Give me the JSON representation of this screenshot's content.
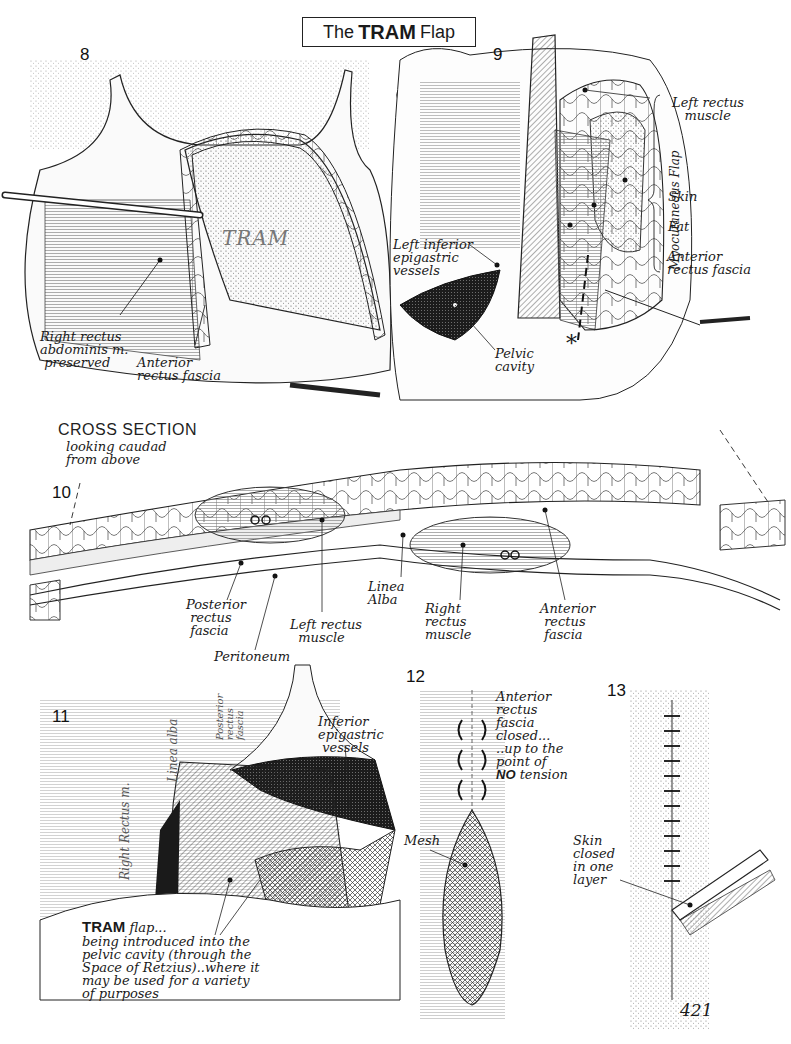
{
  "title": {
    "prefix": "The",
    "bold": "TRAM",
    "suffix": "Flap"
  },
  "page_number": "421",
  "figures": {
    "fig8": {
      "number": "8",
      "flap_text": "TRAM",
      "labels": {
        "right_rectus": "Right rectus\nabdominis m.\n preserved",
        "anterior_fascia": "Anterior\nrectus fascia"
      }
    },
    "fig9": {
      "number": "9",
      "bracket_label": "Myocutaneous Flap",
      "labels": {
        "left_rectus": "Left rectus\n   muscle",
        "skin": "Skin",
        "fat": "Fat",
        "anterior_fascia": "Anterior\nrectus fascia",
        "left_inferior": "Left inferior\nepigastric\nvessels",
        "pelvic_cavity": "Pelvic\ncavity",
        "asterisk": "*"
      }
    },
    "fig10": {
      "number": "10",
      "heading": "CROSS SECTION",
      "subheading": "looking caudad\nfrom above",
      "labels": {
        "posterior_fascia": "Posterior\n rectus\n fascia",
        "peritoneum": "Peritoneum",
        "left_rectus": "Left rectus\n  muscle",
        "linea_alba": "Linea\nAlba",
        "right_rectus": "Right\nrectus\nmuscle",
        "anterior_fascia": "Anterior\n rectus\n fascia"
      }
    },
    "fig11": {
      "number": "11",
      "vertical_labels": {
        "rectus": "Right Rectus m.",
        "linea": "Linea alba",
        "posterior": "Posterior\nrectus\nfascia"
      },
      "labels": {
        "inferior_epigastric": "Inferior\nepigastric\n vessels",
        "caption_bold": "TRAM",
        "caption_rest": " flap...",
        "caption_body": "being introduced into the\npelvic cavity (through the\nSpace of Retzius)..where it\nmay be used for a variety\nof purposes"
      }
    },
    "fig12": {
      "number": "12",
      "labels": {
        "fascia_closed_1": "Anterior\nrectus\nfascia\nclosed...\n..up to the\npoint of",
        "no": "NO",
        "tension": " tension",
        "mesh": "Mesh"
      }
    },
    "fig13": {
      "number": "13",
      "labels": {
        "skin_closed": "Skin\nclosed\nin one\nlayer"
      }
    }
  }
}
